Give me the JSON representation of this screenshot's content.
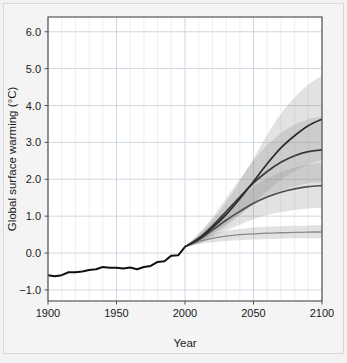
{
  "figure": {
    "background_color": "#f2f2f2",
    "panel_color": "#ffffff",
    "frame_color": "#555555",
    "grid_color": "#dfe3ea"
  },
  "axes": {
    "x_title": "Year",
    "y_title": "Global surface warming (°C)",
    "x_ticks": [
      "1900",
      "1950",
      "2000",
      "2050",
      "2100"
    ],
    "y_ticks": [
      "−1.0",
      "0.0",
      "1.0",
      "2.0",
      "3.0",
      "4.0",
      "5.0",
      "6.0"
    ]
  },
  "chart_data": {
    "type": "line",
    "title": "",
    "xlabel": "Year",
    "ylabel": "Global surface warming (°C)",
    "xlim": [
      1900,
      2100
    ],
    "ylim": [
      -1.3,
      6.4
    ],
    "x_ticks": [
      1900,
      1950,
      2000,
      2050,
      2100
    ],
    "y_ticks": [
      -1.0,
      0.0,
      1.0,
      2.0,
      3.0,
      4.0,
      5.0,
      6.0
    ],
    "grid": true,
    "grid_minor_x_step": 10,
    "legend": "none",
    "series": [
      {
        "name": "Historical observations",
        "color": "#111111",
        "width": 2.0,
        "x": [
          1900,
          1905,
          1910,
          1915,
          1920,
          1925,
          1930,
          1935,
          1940,
          1945,
          1950,
          1955,
          1960,
          1965,
          1970,
          1975,
          1980,
          1985,
          1990,
          1995,
          2000
        ],
        "values": [
          -0.6,
          -0.63,
          -0.6,
          -0.52,
          -0.52,
          -0.5,
          -0.46,
          -0.44,
          -0.38,
          -0.4,
          -0.4,
          -0.42,
          -0.39,
          -0.44,
          -0.38,
          -0.35,
          -0.24,
          -0.22,
          -0.07,
          -0.06,
          0.17
        ]
      },
      {
        "name": "Constant composition commitment",
        "color": "#8a8a8a",
        "width": 1.3,
        "x": [
          2000,
          2010,
          2020,
          2030,
          2040,
          2050,
          2060,
          2070,
          2080,
          2090,
          2100
        ],
        "values": [
          0.17,
          0.31,
          0.4,
          0.46,
          0.5,
          0.52,
          0.54,
          0.55,
          0.56,
          0.57,
          0.57
        ],
        "band_low": [
          0.17,
          0.24,
          0.29,
          0.33,
          0.35,
          0.37,
          0.38,
          0.39,
          0.4,
          0.4,
          0.41
        ],
        "band_high": [
          0.17,
          0.39,
          0.52,
          0.6,
          0.65,
          0.69,
          0.71,
          0.73,
          0.74,
          0.75,
          0.76
        ]
      },
      {
        "name": "B1",
        "color": "#4d4d4d",
        "width": 1.7,
        "x": [
          2000,
          2010,
          2020,
          2030,
          2040,
          2050,
          2060,
          2070,
          2080,
          2090,
          2100
        ],
        "values": [
          0.17,
          0.36,
          0.62,
          0.89,
          1.13,
          1.35,
          1.52,
          1.65,
          1.74,
          1.8,
          1.83
        ],
        "band_low": [
          0.17,
          0.26,
          0.43,
          0.61,
          0.77,
          0.92,
          1.03,
          1.11,
          1.17,
          1.21,
          1.23
        ],
        "band_high": [
          0.17,
          0.47,
          0.82,
          1.19,
          1.52,
          1.8,
          2.03,
          2.2,
          2.32,
          2.4,
          2.44
        ]
      },
      {
        "name": "A1B",
        "color": "#3a3a3a",
        "width": 1.7,
        "x": [
          2000,
          2010,
          2020,
          2030,
          2040,
          2050,
          2060,
          2070,
          2080,
          2090,
          2100
        ],
        "values": [
          0.17,
          0.4,
          0.73,
          1.12,
          1.52,
          1.9,
          2.21,
          2.46,
          2.64,
          2.75,
          2.8
        ],
        "band_low": [
          0.17,
          0.29,
          0.52,
          0.78,
          1.05,
          1.31,
          1.52,
          1.69,
          1.81,
          1.89,
          1.92
        ],
        "band_high": [
          0.17,
          0.53,
          0.97,
          1.48,
          2.0,
          2.5,
          2.92,
          3.25,
          3.48,
          3.63,
          3.7
        ]
      },
      {
        "name": "A2",
        "color": "#2a2a2a",
        "width": 1.7,
        "x": [
          2000,
          2010,
          2020,
          2030,
          2040,
          2050,
          2060,
          2070,
          2080,
          2090,
          2100
        ],
        "values": [
          0.17,
          0.38,
          0.68,
          1.04,
          1.47,
          1.94,
          2.42,
          2.85,
          3.18,
          3.45,
          3.63
        ],
        "band_low": [
          0.17,
          0.27,
          0.48,
          0.73,
          1.03,
          1.35,
          1.68,
          1.98,
          2.21,
          2.4,
          2.52
        ],
        "band_high": [
          0.17,
          0.5,
          0.9,
          1.38,
          1.95,
          2.57,
          3.21,
          3.78,
          4.22,
          4.57,
          4.81
        ]
      }
    ]
  }
}
